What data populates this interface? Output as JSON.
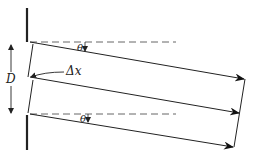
{
  "diagram": {
    "labels": {
      "separation": "D",
      "path_difference": "Δx",
      "angle_top": "θ",
      "angle_bottom": "θ"
    },
    "colors": {
      "line": "#222222",
      "dashed": "#555555",
      "background": "#ffffff"
    }
  }
}
